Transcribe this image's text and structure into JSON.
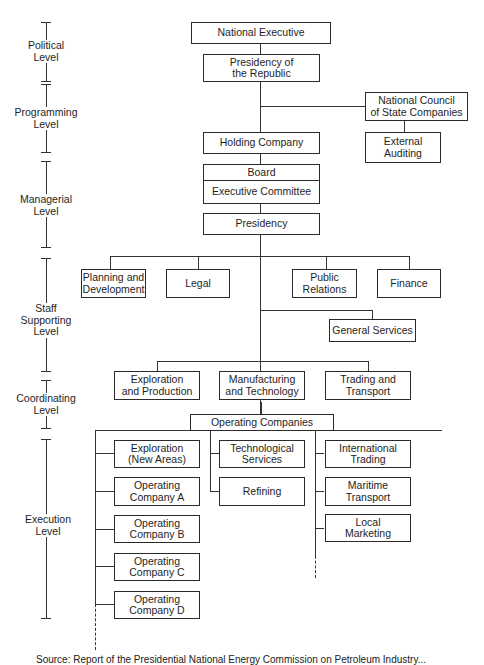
{
  "levels": [
    {
      "label": "Political\nLevel"
    },
    {
      "label": "Programming\nLevel"
    },
    {
      "label": "Managerial\nLevel"
    },
    {
      "label": "Staff\nSupporting\nLevel"
    },
    {
      "label": "Coordinating\nLevel"
    },
    {
      "label": "Execution\nLevel"
    }
  ],
  "nodes": {
    "national_executive": "National Executive",
    "presidency_republic": "Presidency of\nthe Republic",
    "national_council": "National Council\nof State Companies",
    "external_auditing": "External\nAuditing",
    "holding_company": "Holding Company",
    "board": "Board",
    "executive_committee": "Executive Committee",
    "presidency": "Presidency",
    "planning": "Planning and\nDevelopment",
    "legal": "Legal",
    "public_relations": "Public\nRelations",
    "finance": "Finance",
    "general_services": "General Services",
    "exploration_production": "Exploration\nand Production",
    "manufacturing_technology": "Manufacturing\nand Technology",
    "trading_transport": "Trading and\nTransport",
    "operating_companies": "Operating Companies",
    "exploration_new_areas": "Exploration\n(New Areas)",
    "operating_a": "Operating\nCompany A",
    "operating_b": "Operating\nCompany B",
    "operating_c": "Operating\nCompany C",
    "operating_d": "Operating\nCompany D",
    "technological_services": "Technological\nServices",
    "refining": "Refining",
    "international_trading": "International\nTrading",
    "maritime_transport": "Maritime\nTransport",
    "local_marketing": "Local\nMarketing"
  },
  "caption": "Source: Report of the Presidential National Energy Commission on Petroleum Industry..."
}
